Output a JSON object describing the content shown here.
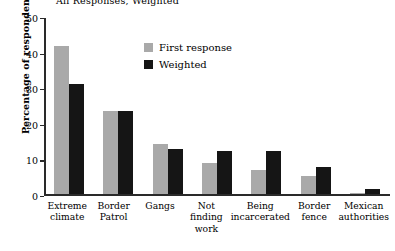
{
  "chart_data": {
    "type": "bar",
    "title": "All Responses, Weighted",
    "xlabel": "",
    "ylabel": "Percentage of respondents",
    "ylim": [
      0,
      50
    ],
    "yticks": [
      0,
      10,
      20,
      30,
      40,
      50
    ],
    "grid": false,
    "legend_position": "upper-center",
    "categories": [
      "Extreme climate",
      "Border Patrol",
      "Gangs",
      "Not finding work",
      "Being incarcerated",
      "Border fence",
      "Mexican authorities"
    ],
    "series": [
      {
        "name": "First response",
        "color": "#a9a9a9",
        "values": [
          41.5,
          23.4,
          14.0,
          8.8,
          6.8,
          5.2,
          0.4
        ]
      },
      {
        "name": "Weighted",
        "color": "#151515",
        "values": [
          31.0,
          23.5,
          12.8,
          12.0,
          12.0,
          7.6,
          1.5
        ]
      }
    ]
  },
  "axis": {
    "y_title": "Percentage of respondents",
    "tick_labels": [
      "0",
      "10",
      "20",
      "30",
      "40",
      "50"
    ]
  },
  "legend": {
    "items": [
      {
        "label": "First response",
        "color": "#a9a9a9"
      },
      {
        "label": "Weighted",
        "color": "#151515"
      }
    ]
  },
  "category_lines": [
    [
      "Extreme",
      "climate"
    ],
    [
      "Border",
      "Patrol"
    ],
    [
      "Gangs"
    ],
    [
      "Not",
      "finding",
      "work"
    ],
    [
      "Being",
      "incarcerated"
    ],
    [
      "Border",
      "fence"
    ],
    [
      "Mexican",
      "authorities"
    ]
  ]
}
